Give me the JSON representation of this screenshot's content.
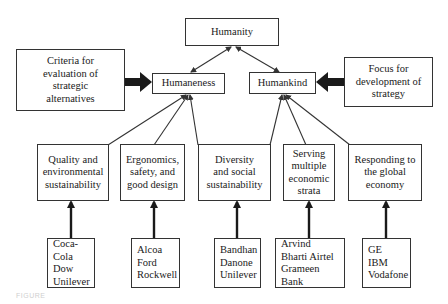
{
  "diagram": {
    "root": {
      "id": "humanity",
      "label": "Humanity"
    },
    "level1": [
      {
        "id": "humaneness",
        "label": "Humaneness"
      },
      {
        "id": "humankind",
        "label": "Humankind"
      }
    ],
    "side_notes": [
      {
        "id": "criteria",
        "label": "Criteria for\nevaluation of\nstrategic\nalternatives",
        "points_to": "humaneness"
      },
      {
        "id": "focus",
        "label": "Focus for\ndevelopment of\nstrategy",
        "points_to": "humankind"
      }
    ],
    "level2": [
      {
        "id": "quality",
        "label": "Quality and\nenvironmental\nsustainability",
        "parent": "humaneness"
      },
      {
        "id": "ergonomics",
        "label": "Ergonomics,\nsafety, and\ngood design",
        "parent": "humaneness"
      },
      {
        "id": "diversity",
        "label": "Diversity\nand social\nsustainability",
        "parent": "humaneness,humankind"
      },
      {
        "id": "serving",
        "label": "Serving\nmultiple\neconomic\nstrata",
        "parent": "humankind"
      },
      {
        "id": "responding",
        "label": "Responding to\nthe global\neconomy",
        "parent": "humankind"
      }
    ],
    "examples": [
      {
        "for": "quality",
        "companies": "Coca-Cola\nDow\nUnilever"
      },
      {
        "for": "ergonomics",
        "companies": "Alcoa\nFord\nRockwell"
      },
      {
        "for": "diversity",
        "companies": "Bandhan\nDanone\nUnilever"
      },
      {
        "for": "serving",
        "companies": "Arvind\nBharti Airtel\nGrameen Bank"
      },
      {
        "for": "responding",
        "companies": "GE\nIBM\nVodafone"
      }
    ],
    "caption": "FIGURE"
  },
  "colors": {
    "stroke": "#333333",
    "text": "#1a1a1a",
    "background": "#ffffff"
  }
}
